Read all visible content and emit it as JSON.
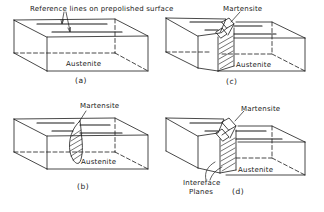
{
  "figure": {
    "panels": [
      {
        "id": "a",
        "caption": "(a)",
        "labels": {
          "top": "Reference lines on prepolished surface",
          "bottom": "Austenite"
        }
      },
      {
        "id": "b",
        "caption": "(b)",
        "labels": {
          "top": "Martensite",
          "bottom": "Austenite"
        }
      },
      {
        "id": "c",
        "caption": "(c)",
        "labels": {
          "top": "Martensite",
          "bottom": "Austenite"
        }
      },
      {
        "id": "d",
        "caption": "(d)",
        "labels": {
          "top": "Martensite",
          "bottom": "Austenite",
          "interface_line1": "Intereface",
          "interface_line2": "Planes"
        }
      }
    ],
    "colors": {
      "line": "#1a1a1a",
      "background": "#ffffff"
    }
  }
}
